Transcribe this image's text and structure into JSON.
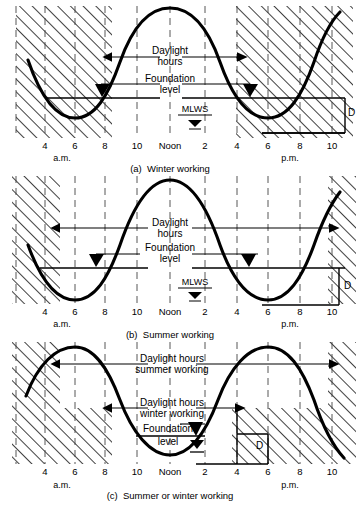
{
  "figure": {
    "type": "engineering-diagram",
    "panel_count": 3
  },
  "axis": {
    "ticks_am": [
      "4",
      "6",
      "8",
      "10"
    ],
    "noon": "Noon",
    "ticks_pm": [
      "2",
      "4",
      "6",
      "8",
      "10"
    ],
    "am_label": "a.m.",
    "pm_label": "p.m."
  },
  "panels": [
    {
      "id": "a",
      "caption": "(a)  Winter working",
      "labels": {
        "daylight": "Daylight",
        "hours": "hours",
        "foundation": "Foundation",
        "level": "level",
        "mlws": "MLWS",
        "depth": "D"
      },
      "tide": {
        "type": "sine",
        "low_tide_hour_am": 6,
        "high_tide_hour": 12,
        "low_tide_hour_pm": 6,
        "period_hours": 12.4
      },
      "daylight_window": {
        "start": "08:30",
        "end": "16:00",
        "note": "short winter daylight band"
      },
      "hatched_regions": [
        "before 08:30 a.m.",
        "after 4 p.m."
      ]
    },
    {
      "id": "b",
      "caption": "(b)  Summer working",
      "labels": {
        "daylight": "Daylight",
        "hours": "hours",
        "foundation": "Foundation",
        "level": "level",
        "mlws": "MLWS",
        "depth": "D"
      },
      "tide": {
        "type": "sine",
        "low_tide_hour_am": 6,
        "high_tide_hour": 12,
        "low_tide_hour_pm": 6,
        "period_hours": 12.4
      },
      "daylight_window": {
        "start": "04:30",
        "end": "21:30",
        "note": "long summer daylight band"
      },
      "hatched_regions": [
        "before 04:30 a.m.",
        "after 9:30 p.m."
      ]
    },
    {
      "id": "c",
      "caption": "(c)  Summer or winter working",
      "labels": {
        "daylight_summer_1": "Daylight hours",
        "daylight_summer_2": "summer working",
        "daylight_winter_1": "Daylight hours",
        "daylight_winter_2": "winter working",
        "foundation": "Foundation",
        "level": "level",
        "depth": "D"
      },
      "tide": {
        "type": "sine",
        "high_tide_hour_am": 6,
        "low_tide_hour": 12,
        "high_tide_hour_pm": 6,
        "period_hours": 12.4,
        "phase_note": "tide shifted - high water mid-morning and mid-evening"
      },
      "daylight_window_summer": {
        "start": "04:30",
        "end": "21:30"
      },
      "daylight_window_winter": {
        "start": "08:30",
        "end": "16:00"
      }
    }
  ],
  "colors": {
    "ink": "#000000",
    "paper": "#ffffff",
    "hatch": "#1a1a1a",
    "grid": "#555555"
  }
}
